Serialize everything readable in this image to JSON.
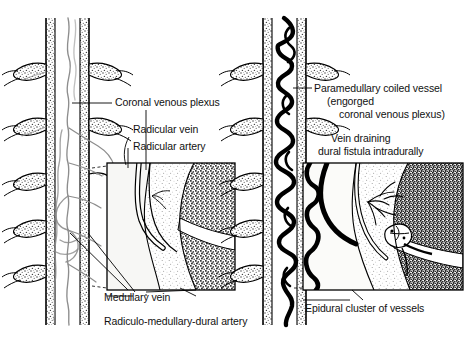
{
  "figure": {
    "type": "anatomical-illustration",
    "background_color": "#ffffff",
    "ink_color": "#000000",
    "vessel_gray": "#8a8a8a",
    "stipple_gray": "#9b9b9b",
    "panel_count": 2
  },
  "panels": [
    {
      "id": "left",
      "name": "normal-spinal-vasculature",
      "labels": [
        {
          "id": "coronal-venous-plexus",
          "text": "Coronal venous plexus"
        },
        {
          "id": "radicular-vein",
          "text": "Radicular vein"
        },
        {
          "id": "radicular-artery",
          "text": "Radicular artery"
        },
        {
          "id": "medullary-vein",
          "text": "Medullary vein"
        },
        {
          "id": "radiculo-medullary-dural-artery",
          "text": "Radiculo-medullary-dural artery"
        }
      ]
    },
    {
      "id": "right",
      "name": "dural-fistula-engorged-vasculature",
      "labels": [
        {
          "id": "paramedullary-coiled-vessel",
          "line1": "Paramedullary coiled vessel",
          "line2": "(engorged",
          "line3": "coronal venous plexus)"
        },
        {
          "id": "vein-draining-dural-fistula",
          "line1": "Vein draining",
          "line2": "dural fistula intradurally"
        },
        {
          "id": "epidural-cluster-of-vessels",
          "text": "Epidural cluster of vessels"
        }
      ]
    }
  ]
}
